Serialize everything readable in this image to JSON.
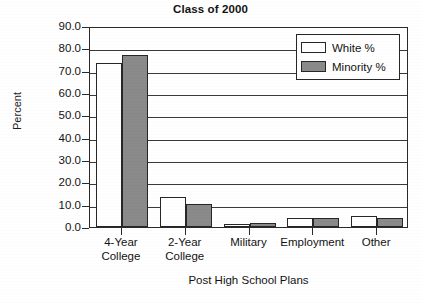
{
  "chart_data": {
    "type": "bar",
    "title": "Class of 2000",
    "xlabel": "Post High School Plans",
    "ylabel": "Percent",
    "categories": [
      "4-Year\nCollege",
      "2-Year\nCollege",
      "Military",
      "Employment",
      "Other"
    ],
    "series": [
      {
        "name": "White %",
        "color": "#ffffff",
        "values": [
          73.5,
          13.5,
          1.3,
          4.0,
          5.0
        ]
      },
      {
        "name": "Minority %",
        "color": "#8a8a8a",
        "values": [
          77.0,
          10.5,
          2.0,
          4.0,
          4.0
        ]
      }
    ],
    "ylim": [
      0.0,
      90.0
    ],
    "ytick_labels": [
      "90.0",
      "80.0",
      "70.0",
      "60.0",
      "50.0",
      "40.0",
      "30.0",
      "20.0",
      "10.0",
      "0.0"
    ],
    "ytick_values": [
      90.0,
      80.0,
      70.0,
      60.0,
      50.0,
      40.0,
      30.0,
      20.0,
      10.0,
      0.0
    ],
    "grid": "horizontal",
    "legend_position": "top-right"
  },
  "legend": {
    "entries": [
      {
        "label": "White %"
      },
      {
        "label": "Minority %"
      }
    ]
  }
}
